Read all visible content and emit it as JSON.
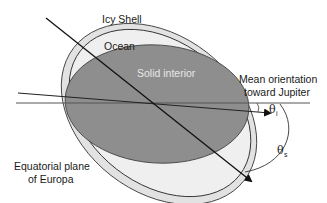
{
  "diagram": {
    "labels": {
      "icy_shell": "Icy Shell",
      "ocean": "Ocean",
      "solid_interior": "Solid interior",
      "mean_orientation_line1": "Mean orientation",
      "mean_orientation_line2": "toward Jupiter",
      "equatorial_line1": "Equatorial plane",
      "equatorial_line2": "of Europa",
      "theta_i_symbol": "θ",
      "theta_i_sub": "i",
      "theta_s_symbol": "θ",
      "theta_s_sub": "s"
    },
    "colors": {
      "icy_shell_fill": "#e4e4e4",
      "ocean_fill": "#ececec",
      "solid_interior_fill": "#8f8f8f",
      "outline": "#3a3a3a",
      "line": "#222222"
    }
  }
}
